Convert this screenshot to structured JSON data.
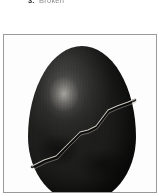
{
  "page": {
    "background_color": "#ffffff",
    "width": 168,
    "height": 193
  },
  "caption": {
    "label": "3.",
    "text": "Broken",
    "truncated": true,
    "bold_color": "#2b2b2b",
    "light_color": "#8d8d8d"
  },
  "figure": {
    "frame_border_color": "#9a9a9a",
    "frame_background": "#ffffff",
    "alt": "photograph of a dark egg-shaped stone with a light zigzag crack",
    "cropped_at_bottom": true
  },
  "photo": {
    "subject": "dark egg",
    "subject_fill_dark": "#1a1a19",
    "subject_fill_mid": "#303030",
    "subject_fill_light": "#4a4a48",
    "highlight_color": "#e1ded6",
    "crack_color": "#d8d4c9",
    "crack_shadow_color": "#070707",
    "crack_label": "zigzag-crack",
    "highlight_label": "specular-highlight"
  }
}
